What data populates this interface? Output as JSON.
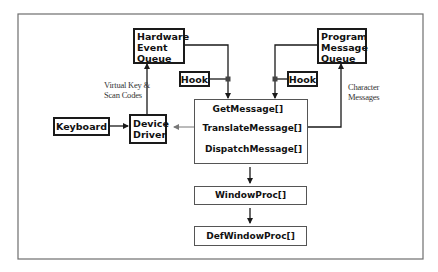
{
  "diagram": {
    "nodes": {
      "hardware_queue": {
        "lines": [
          "Hardware",
          "Event",
          "Queue"
        ]
      },
      "program_queue": {
        "lines": [
          "Program",
          "Message",
          "Queue"
        ]
      },
      "hook_left": {
        "label": "Hook"
      },
      "hook_right": {
        "label": "Hook"
      },
      "keyboard": {
        "label": "Keyboard"
      },
      "device_driver": {
        "lines": [
          "Device",
          "Driver"
        ]
      },
      "message_loop": {
        "functions": [
          "GetMessage[]",
          "TranslateMessage[]",
          "DispatchMessage[]"
        ]
      },
      "window_proc": {
        "label": "WindowProc[]"
      },
      "def_window_proc": {
        "label": "DefWindowProc[]"
      }
    },
    "annotations": {
      "virtual_key": [
        "Virtual Key &",
        "Scan Codes"
      ],
      "character_messages": [
        "Character",
        "Messages"
      ]
    },
    "edges": [
      {
        "from": "keyboard",
        "to": "device_driver"
      },
      {
        "from": "device_driver",
        "to": "hardware_queue",
        "label": "Virtual Key & Scan Codes"
      },
      {
        "from": "device_driver",
        "to": "message_loop.TranslateMessage[]",
        "bidirectional": true
      },
      {
        "from": "hardware_queue",
        "to": "message_loop.GetMessage[]",
        "via": "hook_left"
      },
      {
        "from": "program_queue",
        "to": "message_loop.GetMessage[]",
        "via": "hook_right"
      },
      {
        "from": "message_loop.TranslateMessage[]",
        "to": "program_queue",
        "label": "Character Messages"
      },
      {
        "from": "message_loop",
        "to": "window_proc"
      },
      {
        "from": "window_proc",
        "to": "def_window_proc"
      }
    ],
    "colors": {
      "frame": "#6e6e6e",
      "line": "#1a1a1a",
      "junction": "#444444"
    }
  }
}
